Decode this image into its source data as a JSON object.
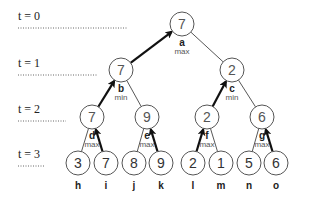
{
  "time_levels": [
    {
      "label": "t = 0",
      "y": 20,
      "line_end": 127
    },
    {
      "label": "t = 1",
      "y": 67,
      "line_end": 97
    },
    {
      "label": "t = 2",
      "y": 113,
      "line_end": 66
    },
    {
      "label": "t = 3",
      "y": 158,
      "line_end": 44
    }
  ],
  "internal_nodes": [
    {
      "id": "a",
      "value": "7",
      "type": "max",
      "x": 182,
      "y": 24
    },
    {
      "id": "b",
      "value": "7",
      "type": "min",
      "x": 121,
      "y": 70
    },
    {
      "id": "c",
      "value": "2",
      "type": "min",
      "x": 232,
      "y": 70
    },
    {
      "id": "d",
      "value": "7",
      "type": "max",
      "x": 92,
      "y": 117
    },
    {
      "id": "e",
      "value": "9",
      "type": "max",
      "x": 147,
      "y": 117
    },
    {
      "id": "f",
      "value": "2",
      "type": "max",
      "x": 207,
      "y": 117
    },
    {
      "id": "g",
      "value": "6",
      "type": "max",
      "x": 262,
      "y": 117
    }
  ],
  "leaves": [
    {
      "id": "h",
      "value": "3",
      "x": 78,
      "y": 163
    },
    {
      "id": "i",
      "value": "7",
      "x": 106,
      "y": 163
    },
    {
      "id": "j",
      "value": "8",
      "x": 134,
      "y": 163
    },
    {
      "id": "k",
      "value": "9",
      "x": 161,
      "y": 163
    },
    {
      "id": "l",
      "value": "2",
      "x": 193,
      "y": 163
    },
    {
      "id": "m",
      "value": "1",
      "x": 221,
      "y": 163
    },
    {
      "id": "n",
      "value": "5",
      "x": 249,
      "y": 163
    },
    {
      "id": "o",
      "value": "6",
      "x": 276,
      "y": 163
    }
  ],
  "edges": [
    {
      "parent": "a",
      "child": "b",
      "chosen": true
    },
    {
      "parent": "a",
      "child": "c",
      "chosen": false
    },
    {
      "parent": "b",
      "child": "d",
      "chosen": true
    },
    {
      "parent": "b",
      "child": "e",
      "chosen": false
    },
    {
      "parent": "c",
      "child": "f",
      "chosen": true
    },
    {
      "parent": "c",
      "child": "g",
      "chosen": false
    },
    {
      "parent": "d",
      "child": "h",
      "chosen": false
    },
    {
      "parent": "d",
      "child": "i",
      "chosen": true
    },
    {
      "parent": "e",
      "child": "j",
      "chosen": false
    },
    {
      "parent": "e",
      "child": "k",
      "chosen": true
    },
    {
      "parent": "f",
      "child": "l",
      "chosen": true
    },
    {
      "parent": "f",
      "child": "m",
      "chosen": false
    },
    {
      "parent": "g",
      "child": "n",
      "chosen": false
    },
    {
      "parent": "g",
      "child": "o",
      "chosen": true
    }
  ],
  "style": {
    "node_radius": 12,
    "node_stroke": "#555555",
    "edge_color": "#444444",
    "chosen_edge_color": "#111111",
    "dotted_color": "#666666"
  }
}
